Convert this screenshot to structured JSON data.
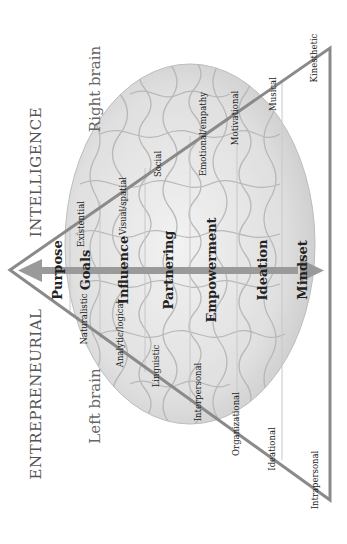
{
  "title": {
    "left": "ENTREPRENEURIAL",
    "right": "INTELLIGENCE"
  },
  "sides": {
    "left": "Left brain",
    "right": "Right brain"
  },
  "levels": [
    {
      "label": "Purpose"
    },
    {
      "label": "Goals"
    },
    {
      "label": "Influence"
    },
    {
      "label": "Partnering"
    },
    {
      "label": "Empowerment"
    },
    {
      "label": "Ideation"
    },
    {
      "label": "Mindset"
    }
  ],
  "left_intelligences": [
    {
      "label": "Naturalistic"
    },
    {
      "label": "Analytic/logical"
    },
    {
      "label": "Linguistic"
    },
    {
      "label": "Interpersonal"
    },
    {
      "label": "Organizational"
    },
    {
      "label": "Ideational"
    },
    {
      "label": "Intrapersonal"
    }
  ],
  "right_intelligences": [
    {
      "label": "Existential"
    },
    {
      "label": "Visual/spatial"
    },
    {
      "label": "Social"
    },
    {
      "label": "Emotional/empathy"
    },
    {
      "label": "Motivational"
    },
    {
      "label": "Musical"
    },
    {
      "label": "Kinesthetic"
    }
  ],
  "colors": {
    "triangle_stroke": "#8a8a8a",
    "arrow": "#9a9a9a",
    "divider": "#c8c8c8",
    "brain_fill": "#e6e6e6",
    "brain_texture": "#b8b8b8"
  }
}
